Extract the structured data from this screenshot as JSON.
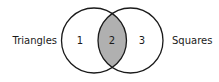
{
  "diagram": {
    "type": "venn",
    "sets": [
      {
        "name": "Triangles",
        "side": "left"
      },
      {
        "name": "Squares",
        "side": "right"
      }
    ],
    "regions": [
      {
        "label": "1",
        "description": "Triangles only"
      },
      {
        "label": "2",
        "description": "Triangles and Squares (shaded)"
      },
      {
        "label": "3",
        "description": "Squares only"
      }
    ],
    "shaded_region": "2",
    "colors": {
      "stroke": "#1a1a1a",
      "shade": "#b0b0b0",
      "background": "#ffffff"
    }
  }
}
